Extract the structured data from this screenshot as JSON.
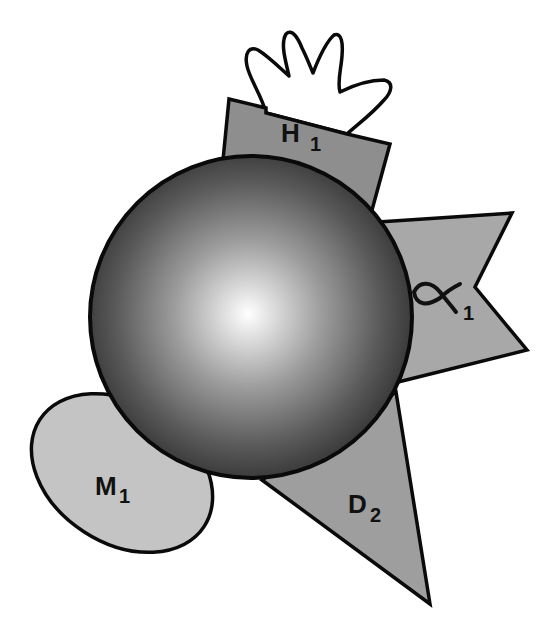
{
  "diagram": {
    "central": {
      "name": "central-sphere",
      "cx": 251,
      "cy": 317,
      "r": 161,
      "highlight": {
        "cx": 248,
        "cy": 314
      },
      "gradient": {
        "inner": "#ffffff",
        "mid": "#9a9a9a",
        "outer": "#3a3a3a"
      },
      "stroke": "#0a0a0a"
    },
    "subunits": [
      {
        "id": "H1",
        "label_main": "H",
        "label_sub": "1",
        "shape": "quadrilateral",
        "fill": "#8e8e8e",
        "points": "229,99 390,144 372,210 223,160",
        "label_pos": {
          "x": 281,
          "y": 142
        }
      },
      {
        "id": "alpha1",
        "label_main": "α",
        "label_sub": "1",
        "shape": "bowtie-notch",
        "fill": "#a8a8a8",
        "points": "378,222 512,213 475,287 527,350 398,382",
        "label_pos": {
          "x": 412,
          "y": 303
        }
      },
      {
        "id": "D2",
        "label_main": "D",
        "label_sub": "2",
        "shape": "triangle",
        "fill": "#9e9e9e",
        "points": "266,482 396,395 430,604",
        "label_pos": {
          "x": 348,
          "y": 513
        }
      },
      {
        "id": "M1",
        "label_main": "M",
        "label_sub": "1",
        "shape": "ellipse",
        "fill": "#c4c4c4",
        "ellipse": {
          "cx": 122,
          "cy": 473,
          "rx": 98,
          "ry": 70,
          "rotate": 33
        },
        "label_pos": {
          "x": 97,
          "y": 495
        }
      }
    ],
    "hand": {
      "name": "hand-shape",
      "fill": "#ffffff",
      "stroke": "#0a0a0a"
    },
    "colors": {
      "background": "#ffffff",
      "outline": "#0a0a0a",
      "label": "#111111"
    }
  }
}
